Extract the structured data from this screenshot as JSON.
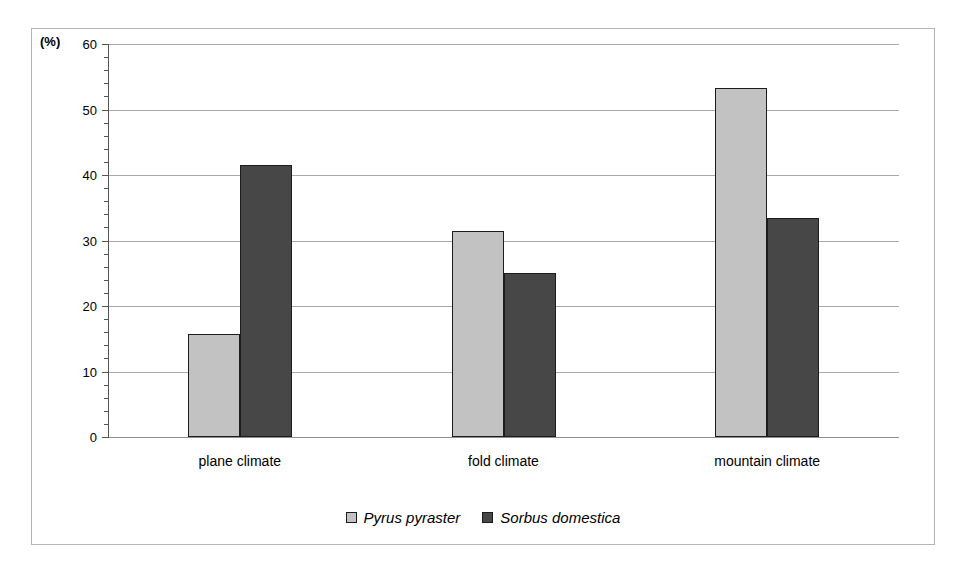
{
  "chart_data": {
    "type": "bar",
    "title": "",
    "subtitle": "",
    "xlabel": "",
    "ylabel": "(%)",
    "unit_caption": "(%)",
    "categories": [
      "plane climate",
      "fold climate",
      "mountain climate"
    ],
    "series": [
      {
        "name": "Pyrus pyraster",
        "color": "#c2c2c2",
        "values": [
          15.7,
          31.4,
          53.3
        ]
      },
      {
        "name": "Sorbus domestica",
        "color": "#474747",
        "values": [
          41.6,
          25.0,
          33.5
        ]
      }
    ],
    "ylim": [
      0,
      60
    ],
    "y_major_ticks": [
      0,
      10,
      20,
      30,
      40,
      50,
      60
    ],
    "y_minor_tick_step": 2,
    "y_tick_labels": [
      "0",
      "10",
      "20",
      "30",
      "40",
      "50",
      "60"
    ],
    "grid": true,
    "grid_axis": "y",
    "legend_position": "bottom",
    "bar_border_color": "#1c1c1c",
    "gridline_color": "#aaaaaa",
    "frame_color": "#b4b4b4",
    "background": "#ffffff"
  }
}
